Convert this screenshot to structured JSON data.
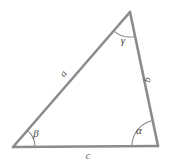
{
  "figure": {
    "kind": "geometry-diagram",
    "width": 169,
    "height": 163,
    "background_color": "#ffffff"
  },
  "style": {
    "line_color": "#8c8c8c",
    "line_width": 2.6,
    "arc_color": "#8c8c8c",
    "arc_width": 1.1,
    "side_label_color": "#555555",
    "angle_label_color": "#444444",
    "side_label_size": 10,
    "angle_label_size": 11
  },
  "vertices": [
    {
      "name": "apex-vertex",
      "id": "C",
      "x": 130,
      "y": 12,
      "angle_label": "γ"
    },
    {
      "name": "bottom-left-vertex",
      "id": "B",
      "x": 13,
      "y": 147,
      "angle_label": "β"
    },
    {
      "name": "bottom-right-vertex",
      "id": "A",
      "x": 158,
      "y": 146,
      "angle_label": "α"
    }
  ],
  "sides": [
    {
      "name": "side-a",
      "label": "a",
      "from": "B",
      "to": "C",
      "label_x": 64,
      "label_y": 74,
      "rotation": -49
    },
    {
      "name": "side-b",
      "label": "b",
      "from": "C",
      "to": "A",
      "label_x": 148,
      "label_y": 80,
      "rotation": -77
    },
    {
      "name": "side-c",
      "label": "c",
      "from": "B",
      "to": "A",
      "label_x": 88,
      "label_y": 157,
      "rotation": 0
    }
  ],
  "angles": [
    {
      "name": "angle-gamma",
      "label": "γ",
      "at": "C",
      "radius": 25,
      "label_x": 123,
      "label_y": 41
    },
    {
      "name": "angle-beta",
      "label": "β",
      "at": "B",
      "radius": 22,
      "label_x": 36,
      "label_y": 134
    },
    {
      "name": "angle-alpha",
      "label": "α",
      "at": "A",
      "radius": 26,
      "label_x": 139,
      "label_y": 131
    }
  ],
  "chart_data": {
    "type": "diagram",
    "title": "",
    "shape": "triangle",
    "points": {
      "B": [
        13,
        147
      ],
      "A": [
        158,
        146
      ],
      "C": [
        130,
        12
      ]
    },
    "edge_labels": [
      "a",
      "b",
      "c"
    ],
    "angle_labels": [
      "α",
      "β",
      "γ"
    ]
  }
}
